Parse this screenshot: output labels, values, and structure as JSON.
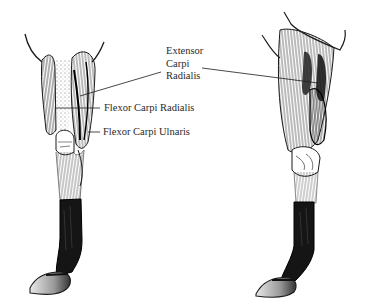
{
  "figure": {
    "background": "#ffffff",
    "ink": "#1a1a1a",
    "boot_color": "#151515"
  },
  "labels": {
    "extensor_carpi_radialis": {
      "line1": "Extensor",
      "line2": "Carpi",
      "line3": "Radialis"
    },
    "flexor_carpi_radialis": "Flexor Carpi Radialis",
    "flexor_carpi_ulnaris": "Flexor Carpi Ulnaris"
  },
  "views": [
    {
      "name": "front-view-leg"
    },
    {
      "name": "side-view-leg"
    }
  ]
}
